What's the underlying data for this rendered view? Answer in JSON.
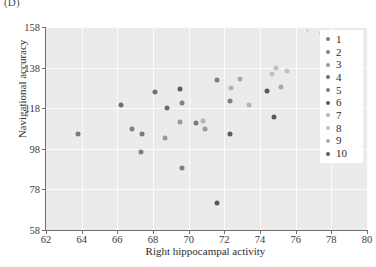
{
  "panel": {
    "label": "(D)"
  },
  "header_clip": "",
  "axes": {
    "x": {
      "title": "Right hippocampal activity",
      "ticks": [
        "62",
        "64",
        "66",
        "68",
        "70",
        "72",
        "74",
        "76",
        "78",
        "80"
      ],
      "min": 62,
      "max": 80
    },
    "y": {
      "title": "Navigational accuracy",
      "ticks": [
        "58",
        "78",
        "98",
        "118",
        "138",
        "158"
      ],
      "min": 58,
      "max": 158
    }
  },
  "legend": {
    "title": "",
    "items": [
      {
        "label": "1",
        "color": "#7a7a7a"
      },
      {
        "label": "2",
        "color": "#808080"
      },
      {
        "label": "3",
        "color": "#9a9a9a"
      },
      {
        "label": "4",
        "color": "#6e6e6e"
      },
      {
        "label": "5",
        "color": "#7f7f7f"
      },
      {
        "label": "6",
        "color": "#595959"
      },
      {
        "label": "7",
        "color": "#b4b4b4"
      },
      {
        "label": "8",
        "color": "#c0c0c0"
      },
      {
        "label": "9",
        "color": "#aaaaaa"
      },
      {
        "label": "10",
        "color": "#5c5c5c"
      }
    ]
  },
  "chart_data": {
    "type": "scatter",
    "title": "",
    "xlabel": "Right hippocampal activity",
    "ylabel": "Navigational accuracy",
    "xlim": [
      62,
      80
    ],
    "ylim": [
      58,
      158
    ],
    "xticks": [
      62,
      64,
      66,
      68,
      70,
      72,
      74,
      76,
      78,
      80
    ],
    "yticks": [
      58,
      78,
      98,
      118,
      138,
      158
    ],
    "grid": true,
    "legend_position": "upper right",
    "series": [
      {
        "name": "1",
        "color": "#7a7a7a",
        "points": [
          {
            "x": 63.8,
            "y": 105.5
          },
          {
            "x": 67.4,
            "y": 105.5
          },
          {
            "x": 70.4,
            "y": 110.5
          }
        ]
      },
      {
        "name": "2",
        "color": "#808080",
        "points": [
          {
            "x": 66.8,
            "y": 108.0
          },
          {
            "x": 69.6,
            "y": 120.5
          },
          {
            "x": 72.3,
            "y": 121.5
          }
        ]
      },
      {
        "name": "3",
        "color": "#9a9a9a",
        "points": [
          {
            "x": 68.7,
            "y": 103.5
          },
          {
            "x": 69.5,
            "y": 111.0
          },
          {
            "x": 70.9,
            "y": 108.0
          }
        ]
      },
      {
        "name": "4",
        "color": "#6e6e6e",
        "points": [
          {
            "x": 66.2,
            "y": 119.5
          },
          {
            "x": 68.1,
            "y": 126.0
          },
          {
            "x": 68.8,
            "y": 118.0
          }
        ]
      },
      {
        "name": "5",
        "color": "#7f7f7f",
        "points": [
          {
            "x": 67.3,
            "y": 96.5
          },
          {
            "x": 69.6,
            "y": 88.5
          },
          {
            "x": 71.6,
            "y": 132.0
          }
        ]
      },
      {
        "name": "6",
        "color": "#595959",
        "points": [
          {
            "x": 71.6,
            "y": 71.5
          },
          {
            "x": 74.8,
            "y": 113.5
          },
          {
            "x": 74.4,
            "y": 126.5
          }
        ]
      },
      {
        "name": "7",
        "color": "#b4b4b4",
        "points": [
          {
            "x": 70.8,
            "y": 111.5
          },
          {
            "x": 72.4,
            "y": 128.0
          },
          {
            "x": 73.4,
            "y": 119.5
          }
        ]
      },
      {
        "name": "8",
        "color": "#c0c0c0",
        "points": [
          {
            "x": 74.7,
            "y": 135.0
          },
          {
            "x": 74.9,
            "y": 138.0
          },
          {
            "x": 75.5,
            "y": 136.5
          }
        ]
      },
      {
        "name": "9",
        "color": "#aaaaaa",
        "points": [
          {
            "x": 72.9,
            "y": 132.5
          },
          {
            "x": 75.2,
            "y": 128.5
          },
          {
            "x": 77.5,
            "y": 155.0
          }
        ]
      },
      {
        "name": "10",
        "color": "#5c5c5c",
        "points": [
          {
            "x": 69.5,
            "y": 127.5
          },
          {
            "x": 72.3,
            "y": 105.5
          }
        ]
      }
    ]
  }
}
